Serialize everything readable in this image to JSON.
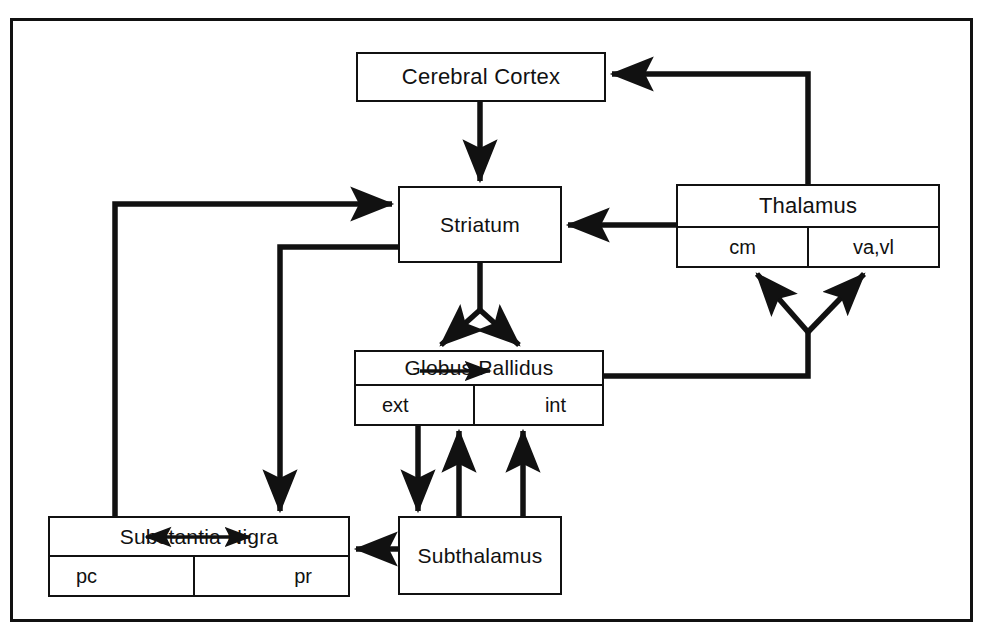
{
  "diagram": {
    "frame": {
      "border_color": "#111111"
    },
    "nodes": [
      {
        "id": "cortex",
        "label": "Cerebral Cortex",
        "subcells": []
      },
      {
        "id": "striatum",
        "label": "Striatum",
        "subcells": []
      },
      {
        "id": "thalamus",
        "label": "Thalamus",
        "subcells": [
          "cm",
          "va,vl"
        ]
      },
      {
        "id": "globus",
        "label": "Globus Pallidus",
        "subcells": [
          "ext",
          "int"
        ]
      },
      {
        "id": "nigra",
        "label": "Substantia Nigra",
        "subcells": [
          "pc",
          "pr"
        ]
      },
      {
        "id": "subthal",
        "label": "Subthalamus",
        "subcells": []
      }
    ],
    "connections": [
      {
        "from": "cortex",
        "to": "striatum",
        "arrow": "single"
      },
      {
        "from": "thalamus",
        "to": "cortex",
        "arrow": "single"
      },
      {
        "from": "thalamus",
        "to": "striatum",
        "arrow": "single"
      },
      {
        "from": "striatum",
        "to": "globus",
        "arrow": "fork-down"
      },
      {
        "from": "globus",
        "to": "thalamus-cm",
        "arrow": "fork-up"
      },
      {
        "from": "globus",
        "to": "thalamus-vavl",
        "arrow": "fork-up"
      },
      {
        "from": "globus-ext",
        "to": "subthalamus",
        "arrow": "single"
      },
      {
        "from": "subthalamus",
        "to": "globus-ext",
        "arrow": "single"
      },
      {
        "from": "subthalamus",
        "to": "globus-int",
        "arrow": "single"
      },
      {
        "from": "subthalamus",
        "to": "nigra",
        "arrow": "single"
      },
      {
        "from": "nigra",
        "to": "striatum",
        "arrow": "single"
      },
      {
        "from": "striatum",
        "to": "nigra",
        "arrow": "single"
      },
      {
        "from": "globus-ext",
        "to": "globus-int",
        "arrow": "single"
      },
      {
        "from": "nigra-pc",
        "to": "nigra-pr",
        "arrow": "double"
      }
    ]
  }
}
